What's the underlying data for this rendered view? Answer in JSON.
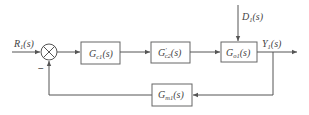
{
  "diagram": {
    "type": "control-loop-block-diagram",
    "colors": {
      "stroke": "#555555",
      "text": "#444444",
      "background": "#ffffff"
    },
    "input": {
      "main": "R",
      "sub": "1",
      "arg": "(s)"
    },
    "summing_junction": {
      "feedback_sign": "−"
    },
    "blocks": {
      "controller1": {
        "main": "G",
        "sub": "c1",
        "sup": "",
        "arg": "(s)"
      },
      "controller2": {
        "main": "G",
        "sub": "c2",
        "sup": "′",
        "arg": "(s)"
      },
      "process": {
        "main": "G",
        "sub": "o1",
        "sup": "",
        "arg": "(s)"
      },
      "measurement": {
        "main": "G",
        "sub": "m1",
        "sup": "",
        "arg": "(s)"
      }
    },
    "disturbance": {
      "main": "D",
      "sub": "1",
      "arg": "(s)"
    },
    "output": {
      "main": "Y",
      "sub": "1",
      "arg": "(s)"
    }
  }
}
